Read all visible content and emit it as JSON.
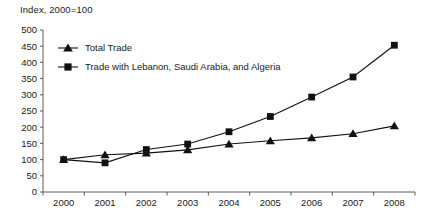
{
  "chart_data": {
    "type": "line",
    "title": "Index, 2000=100",
    "xlabel": "",
    "ylabel": "",
    "ylim": [
      0,
      500
    ],
    "ytick_step": 50,
    "yticks": [
      "0",
      "50",
      "100",
      "150",
      "200",
      "250",
      "300",
      "350",
      "400",
      "450",
      "500"
    ],
    "grid": false,
    "legend_position": "inside-top-left",
    "categories": [
      "2000",
      "2001",
      "2002",
      "2003",
      "2004",
      "2005",
      "2006",
      "2007",
      "2008"
    ],
    "x": [
      2000,
      2001,
      2002,
      2003,
      2004,
      2005,
      2006,
      2007,
      2008
    ],
    "series": [
      {
        "name": "Total Trade",
        "marker": "triangle",
        "color": "#111111",
        "values": [
          100,
          115,
          120,
          130,
          148,
          158,
          167,
          180,
          204
        ]
      },
      {
        "name": "Trade with Lebanon, Saudi Arabia, and Algeria",
        "marker": "square",
        "color": "#111111",
        "values": [
          100,
          90,
          131,
          148,
          186,
          233,
          293,
          355,
          453
        ]
      }
    ]
  },
  "colors": {
    "ink": "#111111",
    "axis": "#4a4a4a",
    "background": "#ffffff"
  }
}
